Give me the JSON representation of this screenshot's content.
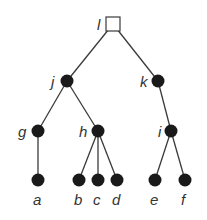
{
  "diagram": {
    "type": "tree",
    "nodes": [
      {
        "id": "l",
        "label": "l",
        "shape": "square",
        "x": 113,
        "y": 24,
        "label_x": 97,
        "label_y": 30
      },
      {
        "id": "j",
        "label": "j",
        "shape": "circle",
        "x": 67,
        "y": 81,
        "label_x": 51,
        "label_y": 87
      },
      {
        "id": "k",
        "label": "k",
        "shape": "circle",
        "x": 158,
        "y": 81,
        "label_x": 140,
        "label_y": 87
      },
      {
        "id": "g",
        "label": "g",
        "shape": "circle",
        "x": 38,
        "y": 131,
        "label_x": 18,
        "label_y": 137
      },
      {
        "id": "h",
        "label": "h",
        "shape": "circle",
        "x": 98,
        "y": 131,
        "label_x": 79,
        "label_y": 137
      },
      {
        "id": "i",
        "label": "i",
        "shape": "circle",
        "x": 171,
        "y": 131,
        "label_x": 158,
        "label_y": 137
      },
      {
        "id": "a",
        "label": "a",
        "shape": "circle",
        "x": 38,
        "y": 180,
        "label_x": 33,
        "label_y": 205
      },
      {
        "id": "b",
        "label": "b",
        "shape": "circle",
        "x": 79,
        "y": 180,
        "label_x": 74,
        "label_y": 205
      },
      {
        "id": "c",
        "label": "c",
        "shape": "circle",
        "x": 98,
        "y": 180,
        "label_x": 93,
        "label_y": 205
      },
      {
        "id": "d",
        "label": "d",
        "shape": "circle",
        "x": 117,
        "y": 180,
        "label_x": 112,
        "label_y": 205
      },
      {
        "id": "e",
        "label": "e",
        "shape": "circle",
        "x": 155,
        "y": 180,
        "label_x": 150,
        "label_y": 205
      },
      {
        "id": "f",
        "label": "f",
        "shape": "circle",
        "x": 185,
        "y": 180,
        "label_x": 181,
        "label_y": 205
      }
    ],
    "edges": [
      [
        "l",
        "j"
      ],
      [
        "l",
        "k"
      ],
      [
        "j",
        "g"
      ],
      [
        "j",
        "h"
      ],
      [
        "k",
        "i"
      ],
      [
        "g",
        "a"
      ],
      [
        "h",
        "b"
      ],
      [
        "h",
        "c"
      ],
      [
        "h",
        "d"
      ],
      [
        "i",
        "e"
      ],
      [
        "i",
        "f"
      ]
    ],
    "colors": {
      "node_fill": "#1a1a1a",
      "edge": "#3a3a3a",
      "label": "#333333",
      "root_fill": "#ffffff"
    }
  }
}
